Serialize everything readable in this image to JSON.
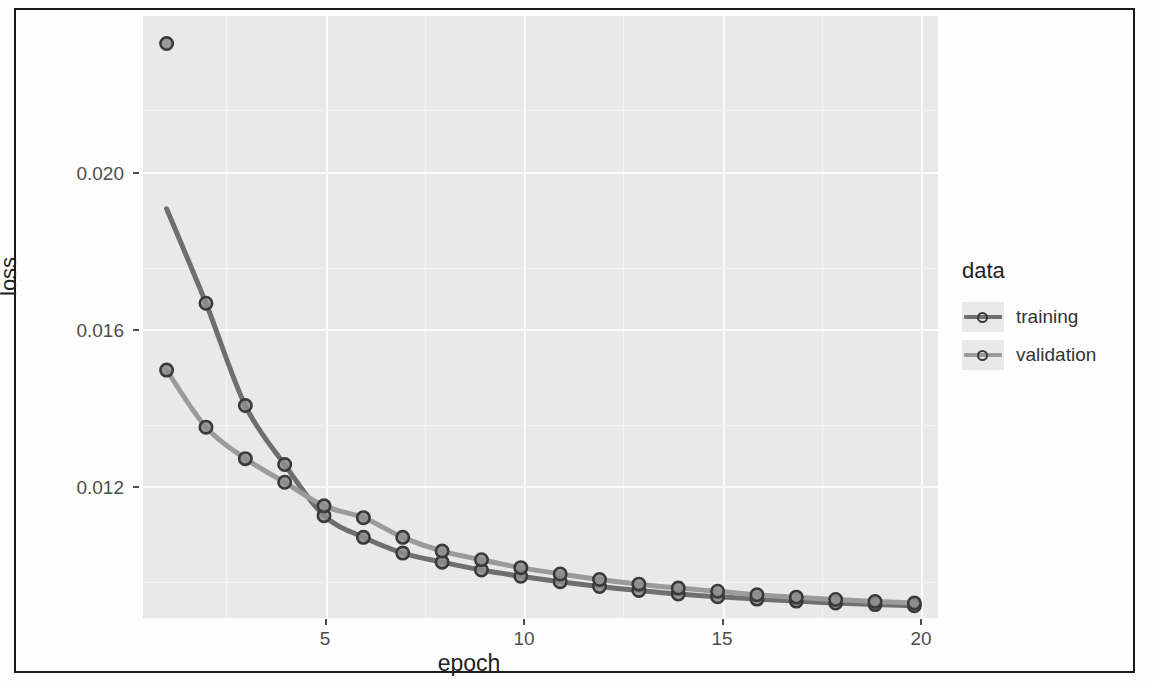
{
  "figure": {
    "y_axis_label": "loss",
    "x_axis_label": "epoch",
    "legend_title": "data"
  },
  "legend": {
    "entries": [
      {
        "label": "training",
        "color": "#6f6f6f",
        "point_color": "#3a3a3a"
      },
      {
        "label": "validation",
        "color": "#9b9b9b",
        "point_color": "#3a3a3a"
      }
    ]
  },
  "axes": {
    "y_ticks": [
      "0.020",
      "0.016",
      "0.012"
    ],
    "x_ticks": [
      "5",
      "10",
      "15",
      "20"
    ]
  },
  "chart_data": {
    "type": "line",
    "title": "",
    "subtitle": "",
    "xlabel": "epoch",
    "ylabel": "loss",
    "xlim": [
      0.4,
      20.6
    ],
    "ylim": [
      0.0092,
      0.0245
    ],
    "xticks": [
      5,
      10,
      15,
      20
    ],
    "yticks": [
      0.012,
      0.016,
      0.02
    ],
    "grid": true,
    "legend_position": "right",
    "legend_title": "data",
    "x": [
      1,
      2,
      3,
      4,
      5,
      6,
      7,
      8,
      9,
      10,
      11,
      12,
      13,
      14,
      15,
      16,
      17,
      18,
      19,
      20
    ],
    "series": [
      {
        "name": "training",
        "color": "#6f6f6f",
        "marker": "circle",
        "values": [
          0.0238,
          0.0172,
          0.0146,
          0.0131,
          0.0118,
          0.01125,
          0.01085,
          0.01062,
          0.01042,
          0.01026,
          0.01012,
          0.01,
          0.0099,
          0.00981,
          0.00974,
          0.00968,
          0.00963,
          0.00958,
          0.00954,
          0.00951
        ],
        "note": "only epoch 1 point visible separately at top; fitted line starts near 0.0196 at epoch 1"
      },
      {
        "name": "validation",
        "color": "#9b9b9b",
        "marker": "circle",
        "values": [
          0.0155,
          0.01405,
          0.01325,
          0.01265,
          0.01205,
          0.01175,
          0.01125,
          0.0109,
          0.01068,
          0.01048,
          0.01032,
          0.01018,
          0.01006,
          0.00996,
          0.00988,
          0.00979,
          0.00973,
          0.00967,
          0.00962,
          0.00958
        ]
      }
    ]
  }
}
